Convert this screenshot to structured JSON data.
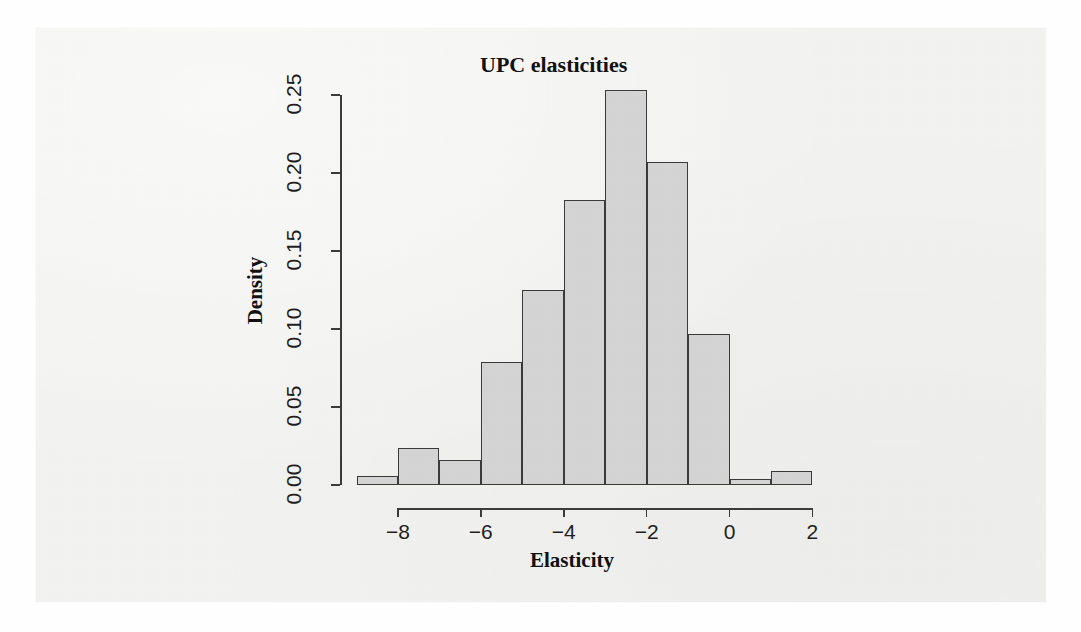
{
  "chart_data": {
    "type": "bar",
    "title": "UPC elasticities",
    "xlabel": "Elasticity",
    "ylabel": "Density",
    "categories": [
      "-9",
      "-8",
      "-7",
      "-6",
      "-5",
      "-4",
      "-3",
      "-2",
      "-1",
      "0",
      "1"
    ],
    "bin_edges": [
      -9,
      -8,
      -7,
      -6,
      -5,
      -4,
      -3,
      -2,
      -1,
      0,
      1,
      2
    ],
    "values": [
      0.006,
      0.024,
      0.016,
      0.079,
      0.125,
      0.183,
      0.253,
      0.207,
      0.097,
      0.004,
      0.009
    ],
    "xlim": [
      -9,
      2
    ],
    "ylim": [
      0.0,
      0.255
    ],
    "xticks": [
      "-8",
      "-6",
      "-4",
      "-2",
      "0",
      "2"
    ],
    "xtick_values": [
      -8,
      -6,
      -4,
      -2,
      0,
      2
    ],
    "yticks": [
      "0.00",
      "0.05",
      "0.10",
      "0.15",
      "0.20",
      "0.25"
    ],
    "ytick_values": [
      0.0,
      0.05,
      0.1,
      0.15,
      0.2,
      0.25
    ],
    "grid": false,
    "legend": null,
    "bar_fill": "#d4d4d4",
    "bar_stroke": "#3a3a3a",
    "background": "#f2f2f0"
  }
}
